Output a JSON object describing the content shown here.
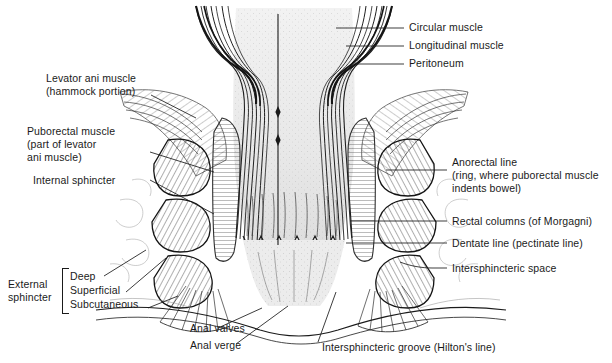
{
  "figure": {
    "type": "anatomical-illustration",
    "background_color": "#ffffff",
    "ink_color": "#1a1a1a",
    "midline_marker": "vertical midline axis line"
  },
  "labels": {
    "right_top": [
      {
        "id": "circular-muscle",
        "text": "Circular muscle"
      },
      {
        "id": "longitudinal-muscle",
        "text": "Longitudinal muscle"
      },
      {
        "id": "peritoneum",
        "text": "Peritoneum"
      }
    ],
    "right_mid": {
      "anorectal_line": [
        "Anorectal line",
        "(ring, where puborectal muscle",
        "indents bowel)"
      ],
      "rectal_columns": "Rectal columns (of Morgagni)",
      "dentate_line": "Dentate line (pectinate line)",
      "intersphincteric_space": "Intersphincteric space"
    },
    "left": {
      "levator_ani": [
        "Levator ani muscle",
        "(hammock portion)"
      ],
      "puborectal": [
        "Puborectal muscle",
        "(part of levator",
        "ani muscle)"
      ],
      "internal_sphincter": "Internal sphincter",
      "external_sphincter": [
        "External",
        "sphincter"
      ],
      "external_parts": [
        "Deep",
        "Superficial",
        "Subcutaneous"
      ]
    },
    "bottom": {
      "anal_valves": "Anal valves",
      "anal_verge": "Anal verge",
      "intersphincteric_groove": "Intersphincteric groove (Hilton's line)"
    }
  }
}
